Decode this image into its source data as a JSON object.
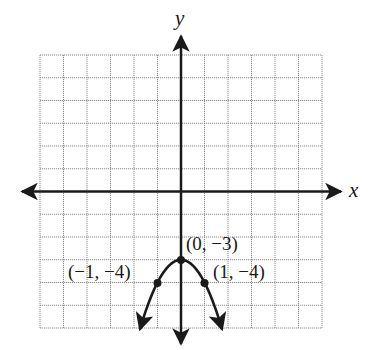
{
  "axes": {
    "x_label": "x",
    "y_label": "y",
    "x_range": [
      -6,
      6
    ],
    "y_range": [
      -6,
      6
    ]
  },
  "points": [
    {
      "label": "(0, −3)",
      "x": 0,
      "y": -3
    },
    {
      "label": "(−1, −4)",
      "x": -1,
      "y": -4
    },
    {
      "label": "(1, −4)",
      "x": 1,
      "y": -4
    }
  ],
  "curve": {
    "equation": "y = -x^2 - 3",
    "type": "parabola",
    "opens": "down"
  },
  "colors": {
    "grid": "#8a8a8a",
    "ink": "#1a1a1a"
  }
}
